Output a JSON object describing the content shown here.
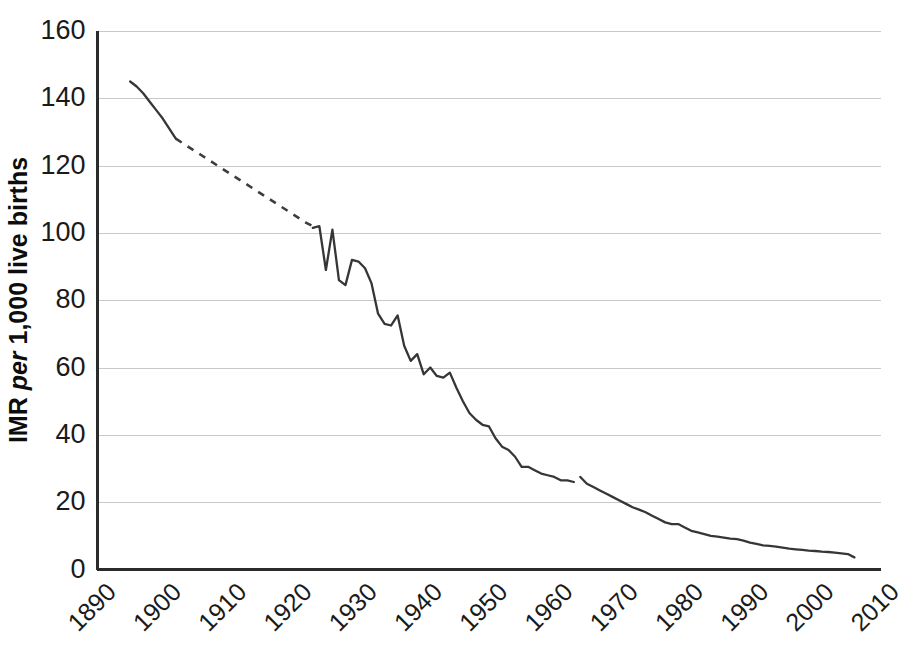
{
  "chart_data": {
    "type": "line",
    "title": "",
    "xlabel": "",
    "ylabel": "IMR per 1,000 live births",
    "ylabel_parts": {
      "prefix": "IMR ",
      "italic": "per",
      "suffix": " 1,000 live births"
    },
    "xlim": [
      1890,
      2010
    ],
    "ylim": [
      0,
      160
    ],
    "ytick_labels": [
      "0",
      "20",
      "40",
      "60",
      "80",
      "100",
      "120",
      "140",
      "160"
    ],
    "ytick_values": [
      0,
      20,
      40,
      60,
      80,
      100,
      120,
      140,
      160
    ],
    "xtick_labels": [
      "1890",
      "1900",
      "1910",
      "1920",
      "1930",
      "1940",
      "1950",
      "1960",
      "1970",
      "1980",
      "1990",
      "2000",
      "2010"
    ],
    "xtick_values": [
      1890,
      1900,
      1910,
      1920,
      1930,
      1940,
      1950,
      1960,
      1970,
      1980,
      1990,
      2000,
      2010
    ],
    "grid": true,
    "grid_axis": "y",
    "legend": false,
    "legend_position": "none",
    "line_color": "#363636",
    "grid_color": "#c9c9c9",
    "axis_color": "#2b2b2b",
    "background_color": "#ffffff",
    "series": [
      {
        "name": "IMR observed (early)",
        "style": "solid",
        "x": [
          1895,
          1896,
          1897,
          1898,
          1899,
          1900,
          1901,
          1902
        ],
        "values": [
          145,
          143.5,
          141.5,
          139,
          136.5,
          134,
          131,
          128
        ]
      },
      {
        "name": "IMR interpolated",
        "style": "dashed",
        "x": [
          1902,
          1906,
          1910,
          1914,
          1918,
          1922,
          1923
        ],
        "values": [
          128,
          123,
          118,
          113,
          108,
          103,
          102
        ]
      },
      {
        "name": "IMR observed (main)",
        "style": "solid",
        "x": [
          1923,
          1924,
          1925,
          1926,
          1927,
          1928,
          1929,
          1930,
          1931,
          1932,
          1933,
          1934,
          1935,
          1936,
          1937,
          1938,
          1939,
          1940,
          1941,
          1942,
          1943,
          1944,
          1945,
          1946,
          1947,
          1948,
          1949,
          1950,
          1951,
          1952,
          1953,
          1954,
          1955,
          1956,
          1957,
          1958,
          1959,
          1960,
          1961,
          1962,
          1963
        ],
        "values": [
          101.5,
          102,
          89,
          101,
          86,
          84.5,
          92,
          91.5,
          89.5,
          85,
          76,
          73,
          72.5,
          75.5,
          66.5,
          62,
          64,
          58,
          60,
          57.5,
          57,
          58.5,
          54,
          50,
          46.5,
          44.5,
          43,
          42.5,
          39,
          36.5,
          35.5,
          33.5,
          30.5,
          30.5,
          29.5,
          28.5,
          28,
          27.5,
          26.5,
          26.5,
          26
        ]
      },
      {
        "name": "IMR observed (post-break)",
        "style": "solid",
        "x": [
          1964,
          1965,
          1966,
          1967,
          1968,
          1969,
          1970,
          1971,
          1972,
          1973,
          1974,
          1975,
          1976,
          1977,
          1978,
          1979,
          1980,
          1981,
          1982,
          1983,
          1984,
          1985,
          1986,
          1987,
          1988,
          1989,
          1990,
          1991,
          1992,
          1993,
          1994,
          1995,
          1996,
          1997,
          1998,
          1999,
          2000,
          2001,
          2002,
          2003,
          2004,
          2005,
          2006
        ],
        "values": [
          27.5,
          25.5,
          24.5,
          23.5,
          22.5,
          21.5,
          20.5,
          19.5,
          18.5,
          17.8,
          17,
          16,
          15,
          14,
          13.5,
          13.5,
          12.5,
          11.5,
          11,
          10.5,
          10,
          9.8,
          9.5,
          9.2,
          9,
          8.6,
          8,
          7.6,
          7.2,
          7,
          6.8,
          6.5,
          6.2,
          6,
          5.8,
          5.6,
          5.5,
          5.3,
          5.2,
          5,
          4.8,
          4.6,
          3.6
        ]
      }
    ],
    "annotations": [
      {
        "type": "series-break",
        "x": 1963.5,
        "note": "discontinuity in the plotted series"
      }
    ]
  }
}
